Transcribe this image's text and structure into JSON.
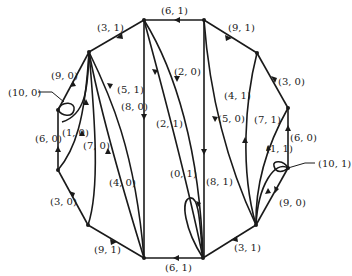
{
  "diagram": {
    "type": "directed-graph-polygon",
    "vertices": [
      {
        "id": "A",
        "x": 144,
        "y": 20
      },
      {
        "id": "B",
        "x": 204,
        "y": 20
      },
      {
        "id": "C",
        "x": 257,
        "y": 53
      },
      {
        "id": "D",
        "x": 288,
        "y": 108
      },
      {
        "id": "E",
        "x": 288,
        "y": 168
      },
      {
        "id": "F",
        "x": 256,
        "y": 225
      },
      {
        "id": "G",
        "x": 203,
        "y": 258
      },
      {
        "id": "H",
        "x": 144,
        "y": 258
      },
      {
        "id": "I",
        "x": 88,
        "y": 225
      },
      {
        "id": "J",
        "x": 58,
        "y": 170
      },
      {
        "id": "K",
        "x": 58,
        "y": 110
      },
      {
        "id": "L",
        "x": 89,
        "y": 52
      }
    ],
    "labels": {
      "top_6_1": "(6, 1)",
      "top_3_1": "(3, 1)",
      "top_9_1": "(9, 1)",
      "right_3_0": "(3, 0)",
      "left_9_0": "(9, 0)",
      "left_10_0": "(10, 0)",
      "left_5_1": "(5, 1)",
      "left_8_0": "(8, 0)",
      "center_2_0": "(2, 0)",
      "center_2_1": "(2, 1)",
      "right_4_1": "(4, 1)",
      "right_5_0": "(5, 0)",
      "right_7_1": "(7, 1)",
      "left_1_0": "(1, 0)",
      "left_6_0": "(6, 0)",
      "left_7_0": "(7, 0)",
      "right_1_1": "(1, 1)",
      "right_6_0": "(6, 0)",
      "right_10_1": "(10, 1)",
      "left_4_0": "(4, 0)",
      "center_0_1": "(0, 1)",
      "center_8_1": "(8, 1)",
      "left_3_0": "(3, 0)",
      "right_9_0": "(9, 0)",
      "bottom_9_1": "(9, 1)",
      "bottom_3_1": "(3, 1)",
      "bottom_6_1": "(6, 1)"
    }
  }
}
